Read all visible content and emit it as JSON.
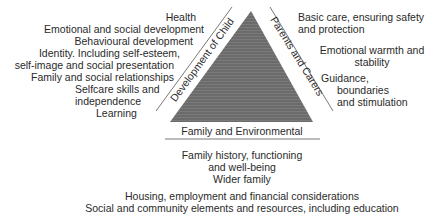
{
  "diagram": {
    "colors": {
      "triangle_fill": "#6b6b6b",
      "stripe": "#7d7d7d",
      "line": "#555555",
      "text": "#2a2a2a"
    },
    "sides": {
      "left_label": "Development of Child",
      "right_label": "Parents and Carers",
      "base_label": "Family and Environmental"
    },
    "child_development": {
      "items": [
        "Health",
        "Emotional and social development",
        "Behavioural development",
        "Identity. Including self-esteem,",
        "self-image and social presentation",
        "Family and social relationships",
        "Selfcare skills and",
        "independence",
        "Learning"
      ]
    },
    "parenting_capacity": {
      "items": [
        "Basic care, ensuring safety",
        "and protection",
        "Emotional warmth and",
        "stability",
        "Guidance,",
        "boundaries",
        "and stimulation"
      ]
    },
    "family_environmental": {
      "items": [
        "Family history, functioning",
        "and well-being",
        "Wider family",
        "Housing, employment and financial considerations",
        "Social and community elements and resources, including education"
      ]
    }
  }
}
